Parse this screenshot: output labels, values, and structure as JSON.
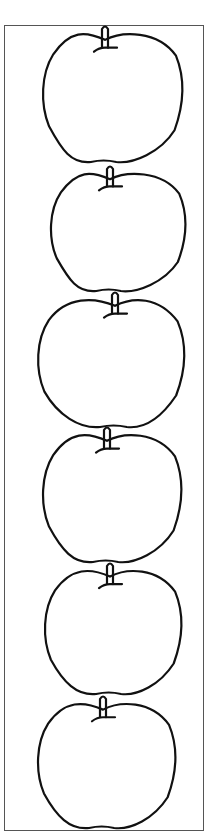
{
  "worksheet": {
    "description": "Six apple outline drawings stacked vertically inside a rectangular border",
    "apple_count": 6,
    "colors": {
      "background": "#ffffff",
      "stroke": "#111111",
      "frame": "#555555"
    },
    "apples": [
      {
        "id": 1,
        "x": 42,
        "y": 32,
        "w": 141,
        "h": 131,
        "stem_x": 105
      },
      {
        "id": 2,
        "x": 50,
        "y": 172,
        "w": 136,
        "h": 120,
        "stem_x": 110
      },
      {
        "id": 3,
        "x": 37,
        "y": 298,
        "w": 148,
        "h": 130,
        "stem_x": 115
      },
      {
        "id": 4,
        "x": 42,
        "y": 433,
        "w": 140,
        "h": 130,
        "stem_x": 107
      },
      {
        "id": 5,
        "x": 44,
        "y": 569,
        "w": 138,
        "h": 126,
        "stem_x": 110
      },
      {
        "id": 6,
        "x": 37,
        "y": 702,
        "w": 139,
        "h": 127,
        "stem_x": 103
      }
    ]
  }
}
